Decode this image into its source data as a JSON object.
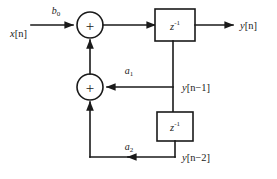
{
  "diagram": {
    "kind": "signal-flow-diagram",
    "background_color": "#ffffff",
    "line_color": "#1a1a1a",
    "input": {
      "label": "x[n]",
      "label_var": "x",
      "label_index": "[n]"
    },
    "output": {
      "label": "y[n]",
      "label_var": "y",
      "label_index": "[n]"
    },
    "gains": [
      {
        "id": "b0",
        "label_var": "b",
        "label_sub": "0",
        "label": "b0"
      },
      {
        "id": "a1",
        "label_var": "a",
        "label_sub": "1",
        "label": "a1"
      },
      {
        "id": "a2",
        "label_var": "a",
        "label_sub": "2",
        "label": "a2"
      }
    ],
    "summers": [
      {
        "id": "summer-top",
        "symbol": "+"
      },
      {
        "id": "summer-bottom",
        "symbol": "+"
      }
    ],
    "delay_blocks": [
      {
        "id": "delay-1",
        "label_var": "z",
        "label_sup": "-1",
        "label": "z-1"
      },
      {
        "id": "delay-2",
        "label_var": "z",
        "label_sup": "-1",
        "label": "z-1"
      }
    ],
    "taps": [
      {
        "id": "tap-y-n-1",
        "label_var": "y",
        "label_index": "[n−1]",
        "label": "y[n-1]"
      },
      {
        "id": "tap-y-n-2",
        "label_var": "y",
        "label_index": "[n−2]",
        "label": "y[n-2]"
      }
    ]
  }
}
